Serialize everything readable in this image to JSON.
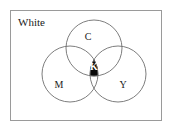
{
  "diagram": {
    "type": "venn-diagram",
    "frame": {
      "label": "White",
      "background_color": "#ffffff",
      "border_color": "#9a9a9a",
      "x": 10,
      "y": 10,
      "width": 152,
      "height": 111
    },
    "circles": [
      {
        "id": "c",
        "label": "C",
        "name": "cyan",
        "cx": 94,
        "cy": 48,
        "r": 28,
        "fill": "none",
        "stroke": "#6e6e6e",
        "label_x": 88,
        "label_y": 38
      },
      {
        "id": "m",
        "label": "M",
        "name": "magenta",
        "cx": 70,
        "cy": 74,
        "r": 28,
        "fill": "none",
        "stroke": "#6e6e6e",
        "label_x": 59,
        "label_y": 86
      },
      {
        "id": "y",
        "label": "Y",
        "name": "yellow",
        "cx": 118,
        "cy": 74,
        "r": 28,
        "fill": "none",
        "stroke": "#6e6e6e",
        "label_x": 123,
        "label_y": 86
      }
    ],
    "intersection": {
      "id": "k",
      "label": "K",
      "name": "black-key",
      "fill": "#0a0a0a",
      "text_color": "#ffffff",
      "label_x": 94,
      "label_y": 68
    }
  }
}
